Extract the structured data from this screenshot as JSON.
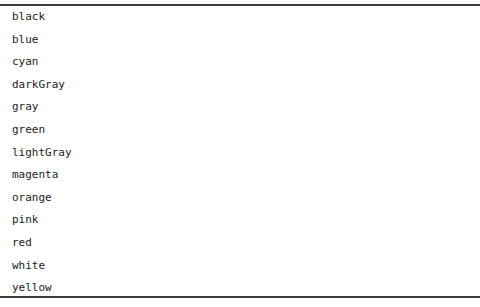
{
  "color_list": {
    "items": [
      {
        "label": "black"
      },
      {
        "label": "blue"
      },
      {
        "label": "cyan"
      },
      {
        "label": "darkGray"
      },
      {
        "label": "gray"
      },
      {
        "label": "green"
      },
      {
        "label": "lightGray"
      },
      {
        "label": "magenta"
      },
      {
        "label": "orange"
      },
      {
        "label": "pink"
      },
      {
        "label": "red"
      },
      {
        "label": "white"
      },
      {
        "label": "yellow"
      }
    ]
  }
}
